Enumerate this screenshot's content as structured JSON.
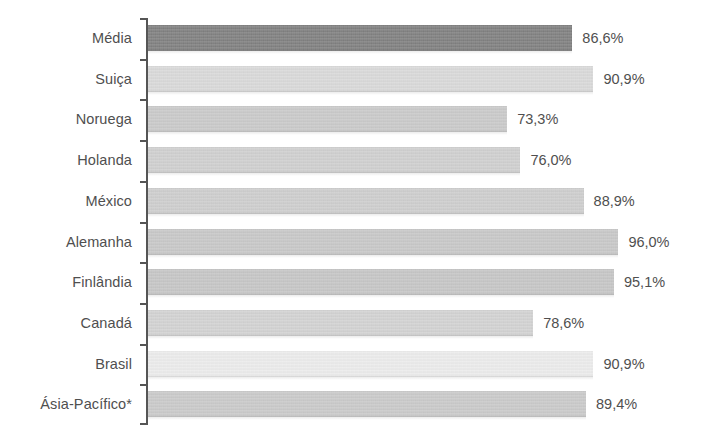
{
  "chart_data": {
    "type": "bar",
    "orientation": "horizontal",
    "title": "",
    "subtitle": "",
    "xlabel": "",
    "ylabel": "",
    "xlim": [
      0,
      100
    ],
    "grid": false,
    "legend": false,
    "value_suffix": "%",
    "decimal_separator": ",",
    "footnote_marker": "*",
    "categories": [
      "Média",
      "Suiça",
      "Noruega",
      "Holanda",
      "México",
      "Alemanha",
      "Finlândia",
      "Canadá",
      "Brasil",
      "Ásia-Pacífico*"
    ],
    "values": [
      86.6,
      90.9,
      73.3,
      76.0,
      88.9,
      96.0,
      95.1,
      78.6,
      90.9,
      89.4
    ],
    "value_labels": [
      "86,6%",
      "90,9%",
      "73,3%",
      "76,0%",
      "88,9%",
      "96,0%",
      "95,1%",
      "78,6%",
      "90,9%",
      "89,4%"
    ],
    "bar_colors": [
      "#7d7d7d",
      "#d9d9d9",
      "#c9c9c9",
      "#cfcfcf",
      "#cdcdcd",
      "#c7c7c7",
      "#c5c5c5",
      "#d2d2d2",
      "#ececec",
      "#c9c9c9"
    ],
    "axis_color": "#555555",
    "text_color": "#4f4f4f",
    "background_color": "#ffffff"
  }
}
